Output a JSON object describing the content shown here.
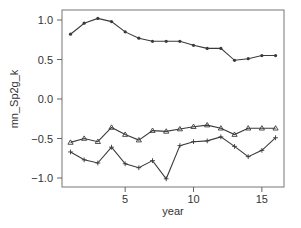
{
  "chart_data": {
    "type": "line",
    "title": "",
    "xlabel": "year",
    "ylabel": "mn_Sp2g_k",
    "xlim": [
      0.3,
      16.8
    ],
    "ylim": [
      -1.1,
      1.13
    ],
    "xticks": [
      5,
      10,
      15
    ],
    "yticks": [
      1.0,
      0.5,
      0.0,
      -0.5,
      -1.0
    ],
    "xtick_labels": [
      "5",
      "10",
      "15"
    ],
    "ytick_labels": [
      "1.0",
      "0.5",
      "0.0",
      "−0.5",
      "−1.0"
    ],
    "grid": false,
    "legend": null,
    "x": [
      1,
      2,
      3,
      4,
      5,
      6,
      7,
      8,
      9,
      10,
      11,
      12,
      13,
      14,
      15,
      16
    ],
    "series": [
      {
        "name": "series_dot",
        "marker": "dot",
        "values": [
          0.82,
          0.96,
          1.02,
          0.98,
          0.85,
          0.77,
          0.73,
          0.73,
          0.73,
          0.68,
          0.64,
          0.64,
          0.49,
          0.51,
          0.55,
          0.55
        ]
      },
      {
        "name": "series_triangle",
        "marker": "triangle",
        "values": [
          -0.55,
          -0.5,
          -0.54,
          -0.36,
          -0.45,
          -0.52,
          -0.4,
          -0.41,
          -0.38,
          -0.35,
          -0.33,
          -0.37,
          -0.45,
          -0.37,
          -0.37,
          -0.37
        ]
      },
      {
        "name": "series_plus",
        "marker": "plus",
        "values": [
          -0.67,
          -0.77,
          -0.81,
          -0.61,
          -0.82,
          -0.87,
          -0.78,
          -1.01,
          -0.59,
          -0.54,
          -0.53,
          -0.48,
          -0.6,
          -0.73,
          -0.65,
          -0.49
        ]
      }
    ]
  },
  "colors": {
    "line": "#3a3a3a",
    "axis": "#666666",
    "text": "#333333"
  }
}
